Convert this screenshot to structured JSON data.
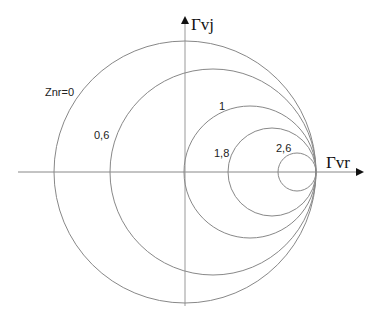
{
  "diagram": {
    "title": "",
    "axes": {
      "x_label": "Γvr",
      "y_label": "Γvj"
    },
    "circles": [
      {
        "label": "Znr=0",
        "r": 0
      },
      {
        "label": "0,6",
        "r": 0.6
      },
      {
        "label": "1",
        "r": 1
      },
      {
        "label": "1,8",
        "r": 1.8
      },
      {
        "label": "2,6",
        "r": 2.6
      }
    ],
    "colors": {
      "lines": "#888888",
      "text": "#222222",
      "background": "#ffffff"
    }
  }
}
